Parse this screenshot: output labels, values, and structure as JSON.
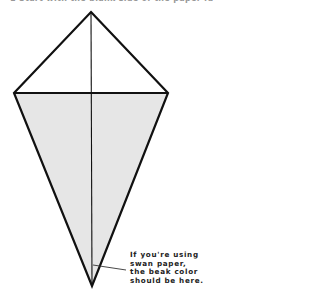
{
  "instruction": {
    "text": "1 Start with the blank side of the paper facing up."
  },
  "diagram": {
    "type": "origami-kite-base",
    "fill_color": "#e6e6e6",
    "stroke_color": "#111111",
    "vertices": {
      "top": [
        91,
        12
      ],
      "left": [
        14,
        93
      ],
      "right": [
        168,
        93
      ],
      "bottom": [
        92,
        286
      ]
    }
  },
  "annotation": {
    "lines": [
      "If you're using",
      "swan paper,",
      "the beak color",
      "should be here."
    ]
  }
}
